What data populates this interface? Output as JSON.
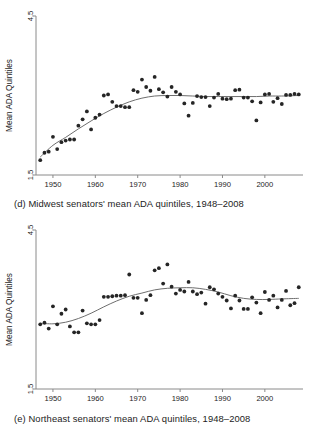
{
  "figure": {
    "panels": [
      {
        "id": "d",
        "caption": "(d) Midwest senators' mean ADA quintiles, 1948–2008"
      },
      {
        "id": "e",
        "caption": "(e) Northeast senators' mean ADA quintiles, 1948–2008"
      }
    ],
    "colors": {
      "point": "#252525",
      "trend_line": "#6e6e6e",
      "axis": "#8a8a8a",
      "text": "#1c1c1c",
      "background": "#ffffff"
    }
  },
  "chart_data": [
    {
      "type": "scatter",
      "title": "(d) Midwest senators' mean ADA quintiles, 1948–2008",
      "panel_label": "(d)",
      "xlabel": "",
      "ylabel": "Mean ADA Quintiles",
      "xlim": [
        1946,
        2009
      ],
      "ylim": [
        1.5,
        4.5
      ],
      "yticks": [
        1.5,
        4.5
      ],
      "ytick_labels": [
        "1.5",
        "4.5"
      ],
      "xticks": [
        1950,
        1960,
        1970,
        1980,
        1990,
        2000
      ],
      "xtick_labels": [
        "1950",
        "1960",
        "1970",
        "1980",
        "1990",
        "2000"
      ],
      "grid": false,
      "legend": "none",
      "series": [
        {
          "name": "Midwest senators' mean ADA quintile",
          "marker": "filled-circle",
          "x": [
            1947,
            1948,
            1949,
            1950,
            1951,
            1952,
            1953,
            1954,
            1955,
            1956,
            1957,
            1958,
            1959,
            1960,
            1961,
            1962,
            1963,
            1964,
            1965,
            1966,
            1967,
            1968,
            1969,
            1970,
            1971,
            1972,
            1973,
            1974,
            1975,
            1976,
            1977,
            1978,
            1979,
            1980,
            1981,
            1982,
            1983,
            1984,
            1985,
            1986,
            1987,
            1988,
            1989,
            1990,
            1991,
            1992,
            1993,
            1994,
            1995,
            1996,
            1997,
            1998,
            1999,
            2000,
            2001,
            2002,
            2003,
            2004,
            2005,
            2006,
            2007,
            2008
          ],
          "y": [
            1.78,
            1.92,
            1.94,
            2.22,
            1.99,
            2.12,
            2.15,
            2.17,
            2.17,
            2.43,
            2.55,
            2.7,
            2.36,
            2.58,
            2.64,
            3.0,
            3.02,
            2.88,
            2.8,
            2.8,
            2.78,
            2.78,
            3.1,
            3.07,
            3.3,
            3.16,
            3.09,
            3.35,
            3.12,
            3.06,
            2.98,
            3.16,
            3.07,
            3.02,
            2.85,
            2.62,
            2.86,
            2.99,
            2.97,
            2.97,
            2.8,
            2.96,
            3.03,
            2.94,
            2.93,
            2.94,
            3.1,
            3.11,
            2.96,
            2.96,
            2.89,
            2.53,
            2.87,
            3.02,
            3.03,
            2.88,
            2.95,
            2.84,
            3.01,
            3.01,
            3.03,
            3.02
          ]
        }
      ],
      "trend": {
        "name": "lowess smoother",
        "x": [
          1947,
          1950,
          1953,
          1956,
          1959,
          1962,
          1965,
          1968,
          1971,
          1974,
          1977,
          1980,
          1983,
          1986,
          1989,
          1992,
          1995,
          1998,
          2001,
          2004,
          2008
        ],
        "y": [
          1.84,
          2.06,
          2.21,
          2.37,
          2.52,
          2.66,
          2.78,
          2.88,
          2.95,
          2.99,
          3.0,
          3.0,
          2.99,
          2.98,
          2.98,
          2.98,
          2.98,
          2.98,
          2.99,
          2.99,
          3.0
        ]
      }
    },
    {
      "type": "scatter",
      "title": "(e) Northeast senators' mean ADA quintiles, 1948–2008",
      "panel_label": "(e)",
      "xlabel": "",
      "ylabel": "Mean ADA Quintiles",
      "xlim": [
        1946,
        2009
      ],
      "ylim": [
        1.5,
        4.5
      ],
      "yticks": [
        1.5,
        4.5
      ],
      "ytick_labels": [
        "1.5",
        "4.5"
      ],
      "xticks": [
        1950,
        1960,
        1970,
        1980,
        1990,
        2000
      ],
      "xtick_labels": [
        "1950",
        "1960",
        "1970",
        "1980",
        "1990",
        "2000"
      ],
      "grid": false,
      "legend": "none",
      "series": [
        {
          "name": "Northeast senators' mean ADA quintile",
          "marker": "filled-circle",
          "x": [
            1947,
            1948,
            1949,
            1950,
            1951,
            1952,
            1953,
            1954,
            1955,
            1956,
            1957,
            1958,
            1959,
            1960,
            1961,
            1962,
            1963,
            1964,
            1965,
            1966,
            1967,
            1968,
            1969,
            1970,
            1971,
            1972,
            1973,
            1974,
            1975,
            1976,
            1977,
            1978,
            1979,
            1980,
            1981,
            1982,
            1983,
            1984,
            1985,
            1986,
            1987,
            1988,
            1989,
            1990,
            1991,
            1992,
            1993,
            1994,
            1995,
            1996,
            1997,
            1998,
            1999,
            2000,
            2001,
            2002,
            2003,
            2004,
            2005,
            2006,
            2007,
            2008
          ],
          "y": [
            2.72,
            2.75,
            2.64,
            3.06,
            2.72,
            2.92,
            3.0,
            2.68,
            2.57,
            2.57,
            2.98,
            2.74,
            2.72,
            2.72,
            2.8,
            3.24,
            3.24,
            3.25,
            3.26,
            3.26,
            3.27,
            3.66,
            3.22,
            3.22,
            2.93,
            3.18,
            3.27,
            3.74,
            3.78,
            3.49,
            3.85,
            3.43,
            3.3,
            3.37,
            3.34,
            3.52,
            3.34,
            3.29,
            3.32,
            3.11,
            3.42,
            3.38,
            3.3,
            3.24,
            3.17,
            3.02,
            3.26,
            3.17,
            3.01,
            3.01,
            3.23,
            3.13,
            2.93,
            3.33,
            3.18,
            3.26,
            3.04,
            3.18,
            3.35,
            3.08,
            3.12,
            3.42
          ]
        }
      ],
      "trend": {
        "name": "lowess smoother",
        "x": [
          1947,
          1950,
          1953,
          1956,
          1959,
          1962,
          1965,
          1968,
          1971,
          1974,
          1977,
          1980,
          1983,
          1986,
          1989,
          1992,
          1995,
          1998,
          2001,
          2004,
          2008
        ],
        "y": [
          2.74,
          2.73,
          2.76,
          2.83,
          2.93,
          3.05,
          3.16,
          3.25,
          3.31,
          3.37,
          3.4,
          3.41,
          3.41,
          3.38,
          3.33,
          3.26,
          3.21,
          3.19,
          3.19,
          3.2,
          3.21
        ]
      }
    }
  ]
}
